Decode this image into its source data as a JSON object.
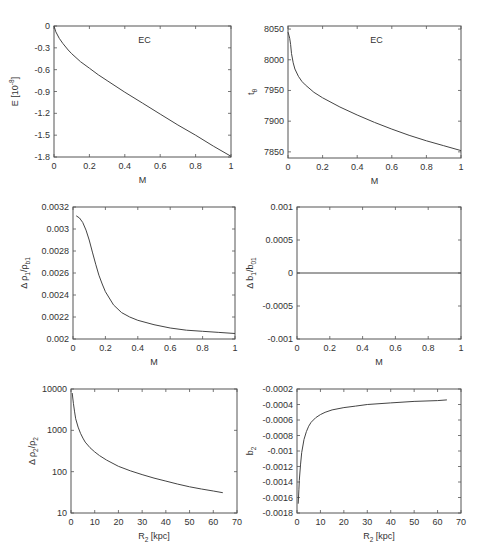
{
  "figure": {
    "rows": 3,
    "cols": 2,
    "line_color": "#444444",
    "frame_color": "#555555"
  },
  "chart_data": [
    {
      "id": "energy-vs-M",
      "type": "line",
      "title": "",
      "annotation": "EC",
      "xlabel": "M",
      "ylabel": "E [10^-8]",
      "ylabel_parts": [
        "E [10",
        "-8",
        "]"
      ],
      "xlim": [
        0,
        1
      ],
      "ylim": [
        -1.8,
        0
      ],
      "xticks": [
        0,
        0.2,
        0.4,
        0.6,
        0.8,
        1
      ],
      "xtick_labels": [
        "0",
        "0.2",
        "0.4",
        "0.6",
        "0.8",
        "1"
      ],
      "yticks": [
        0,
        -0.3,
        -0.6,
        -0.9,
        -1.2,
        -1.5,
        -1.8
      ],
      "ytick_labels": [
        "0",
        "-0.3",
        "-0.6",
        "-0.9",
        "-1.2",
        "-1.5",
        "-1.8"
      ],
      "yscale": "linear",
      "box": [
        54,
        26,
        231,
        157
      ],
      "series": [
        {
          "name": "EC",
          "x": [
            0,
            0.01,
            0.03,
            0.05,
            0.08,
            0.1,
            0.15,
            0.2,
            0.25,
            0.3,
            0.4,
            0.5,
            0.6,
            0.7,
            0.8,
            0.9,
            1.0
          ],
          "y": [
            0,
            -0.08,
            -0.17,
            -0.24,
            -0.33,
            -0.38,
            -0.49,
            -0.58,
            -0.67,
            -0.75,
            -0.91,
            -1.06,
            -1.21,
            -1.36,
            -1.5,
            -1.65,
            -1.79
          ]
        }
      ]
    },
    {
      "id": "t-vs-M",
      "type": "line",
      "annotation": "EC",
      "xlabel": "M",
      "ylabel": "t_θ",
      "ylabel_parts": [
        "t",
        "θ",
        ""
      ],
      "xlim": [
        0,
        1
      ],
      "ylim": [
        7840,
        8055
      ],
      "xticks": [
        0,
        0.2,
        0.4,
        0.6,
        0.8,
        1
      ],
      "xtick_labels": [
        "0",
        "0.2",
        "0.4",
        "0.6",
        "0.8",
        "1"
      ],
      "yticks": [
        7850,
        7900,
        7950,
        8000,
        8050
      ],
      "ytick_labels": [
        "7850",
        "7900",
        "7950",
        "8000",
        "8050"
      ],
      "yscale": "linear",
      "box": [
        288,
        26,
        461,
        158
      ],
      "series": [
        {
          "name": "EC",
          "x": [
            0,
            0.005,
            0.01,
            0.015,
            0.02,
            0.03,
            0.04,
            0.06,
            0.08,
            0.1,
            0.15,
            0.2,
            0.3,
            0.4,
            0.5,
            0.6,
            0.7,
            0.8,
            0.9,
            1.0
          ],
          "y": [
            8045,
            8040,
            8035,
            8025,
            8010,
            7995,
            7985,
            7973,
            7965,
            7959,
            7947,
            7938,
            7923,
            7910,
            7898,
            7887,
            7877,
            7868,
            7860,
            7852
          ]
        }
      ]
    },
    {
      "id": "delta-rho1-vs-M",
      "type": "line",
      "xlabel": "M",
      "ylabel": "Δ ρ1/ρb1",
      "ylabel_parts": [
        "Δ ρ",
        "1",
        "/ρ",
        "b1"
      ],
      "xlim": [
        0,
        1
      ],
      "ylim": [
        0.002,
        0.0032
      ],
      "xticks": [
        0,
        0.2,
        0.4,
        0.6,
        0.8,
        1
      ],
      "xtick_labels": [
        "0",
        "0.2",
        "0.4",
        "0.6",
        "0.8",
        "1"
      ],
      "yticks": [
        0.002,
        0.0022,
        0.0024,
        0.0026,
        0.0028,
        0.003,
        0.0032
      ],
      "ytick_labels": [
        "0.002",
        "0.0022",
        "0.0024",
        "0.0026",
        "0.0028",
        "0.003",
        "0.0032"
      ],
      "yscale": "linear",
      "box": [
        73,
        207,
        235,
        339
      ],
      "series": [
        {
          "name": "",
          "x": [
            0.02,
            0.04,
            0.06,
            0.08,
            0.1,
            0.12,
            0.14,
            0.16,
            0.18,
            0.2,
            0.25,
            0.3,
            0.35,
            0.4,
            0.5,
            0.6,
            0.7,
            0.8,
            0.9,
            1.0
          ],
          "y": [
            0.00312,
            0.0031,
            0.00306,
            0.00299,
            0.0029,
            0.00279,
            0.00268,
            0.00258,
            0.0025,
            0.00243,
            0.00231,
            0.00224,
            0.0022,
            0.00217,
            0.00213,
            0.0021,
            0.00208,
            0.00207,
            0.00206,
            0.00205
          ]
        }
      ]
    },
    {
      "id": "delta-b1-vs-M",
      "type": "line",
      "xlabel": "M",
      "ylabel": "Δ b1/b01",
      "ylabel_parts": [
        "Δ b",
        "1",
        "/b",
        "01"
      ],
      "xlim": [
        0,
        1
      ],
      "ylim": [
        -0.001,
        0.001
      ],
      "xticks": [
        0,
        0.2,
        0.4,
        0.6,
        0.8,
        1
      ],
      "xtick_labels": [
        "0",
        "0.2",
        "0.4",
        "0.6",
        "0.8",
        "1"
      ],
      "yticks": [
        -0.001,
        -0.0005,
        0,
        0.0005,
        0.001
      ],
      "ytick_labels": [
        "-0.001",
        "-0.0005",
        "0",
        "0.0005",
        "0.001"
      ],
      "yscale": "linear",
      "box": [
        297,
        207,
        461,
        339
      ],
      "series": [
        {
          "name": "",
          "x": [
            0,
            1
          ],
          "y": [
            0,
            0
          ]
        }
      ]
    },
    {
      "id": "delta-rho2-vs-R2",
      "type": "line",
      "xlabel": "R2 [kpc]",
      "xlabel_parts": [
        "R",
        "2",
        " [kpc]"
      ],
      "ylabel": "Δ ρ2/ρ2",
      "ylabel_parts": [
        "Δ ρ",
        "2",
        "/ρ",
        "2"
      ],
      "xlim": [
        0,
        70
      ],
      "ylim": [
        10,
        10000
      ],
      "xticks": [
        0,
        10,
        20,
        30,
        40,
        50,
        60,
        70
      ],
      "xtick_labels": [
        "0",
        "10",
        "20",
        "30",
        "40",
        "50",
        "60",
        "70"
      ],
      "yticks": [
        10,
        100,
        1000,
        10000
      ],
      "ytick_labels": [
        "10",
        "100",
        "1000",
        "10000"
      ],
      "yscale": "log",
      "box": [
        71,
        389,
        237,
        513
      ],
      "series": [
        {
          "name": "",
          "x": [
            0.5,
            1,
            1.5,
            2,
            3,
            4,
            5,
            6,
            8,
            10,
            12,
            15,
            20,
            25,
            30,
            35,
            40,
            45,
            50,
            55,
            60,
            64
          ],
          "y": [
            8000,
            4500,
            2800,
            1900,
            1200,
            850,
            650,
            520,
            380,
            300,
            245,
            190,
            135,
            105,
            85,
            70,
            59,
            50,
            43,
            38,
            34,
            31
          ]
        }
      ]
    },
    {
      "id": "b2-vs-R2",
      "type": "line",
      "xlabel": "R2 [kpc]",
      "xlabel_parts": [
        "R",
        "2",
        " [kpc]"
      ],
      "ylabel": "b2",
      "ylabel_parts": [
        "b",
        "2",
        ""
      ],
      "xlim": [
        0,
        70
      ],
      "ylim": [
        -0.0018,
        -0.0002
      ],
      "xticks": [
        0,
        10,
        20,
        30,
        40,
        50,
        60,
        70
      ],
      "xtick_labels": [
        "0",
        "10",
        "20",
        "30",
        "40",
        "50",
        "60",
        "70"
      ],
      "yticks": [
        -0.0018,
        -0.0016,
        -0.0014,
        -0.0012,
        -0.001,
        -0.0008,
        -0.0006,
        -0.0004,
        -0.0002
      ],
      "ytick_labels": [
        "-0.0018",
        "-0.0016",
        "-0.0014",
        "-0.0012",
        "-0.001",
        "-0.0008",
        "-0.0006",
        "-0.0004",
        "-0.0002"
      ],
      "yscale": "linear",
      "box": [
        297,
        389,
        461,
        513
      ],
      "series": [
        {
          "name": "",
          "x": [
            0.5,
            0.8,
            1,
            1.5,
            2,
            3,
            4,
            5,
            6,
            8,
            10,
            12,
            15,
            20,
            25,
            30,
            40,
            50,
            60,
            64
          ],
          "y": [
            -0.00168,
            -0.0015,
            -0.00138,
            -0.00118,
            -0.00102,
            -0.00085,
            -0.00075,
            -0.00068,
            -0.00063,
            -0.00057,
            -0.00053,
            -0.0005,
            -0.00047,
            -0.00044,
            -0.00042,
            -0.0004,
            -0.00038,
            -0.00036,
            -0.00035,
            -0.00034
          ]
        }
      ]
    }
  ]
}
